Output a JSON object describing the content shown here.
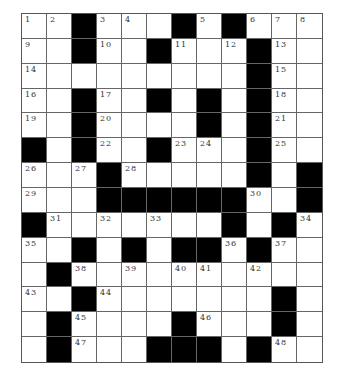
{
  "puzzle": {
    "rows": 14,
    "cols": 12,
    "colors": {
      "block": "#000000",
      "cell": "#ffffff",
      "line": "#666666",
      "number": "#333333"
    },
    "grid": [
      [
        "1",
        "2",
        "#",
        "3",
        "4",
        ".",
        "#",
        "5",
        "#",
        "6",
        "7",
        "8"
      ],
      [
        "9",
        ".",
        "#",
        "10",
        ".",
        "#",
        "11",
        ".",
        "12",
        "#",
        "13",
        "."
      ],
      [
        "14",
        ".",
        ".",
        ".",
        ".",
        ".",
        ".",
        ".",
        ".",
        "#",
        "15",
        "."
      ],
      [
        "16",
        ".",
        "#",
        "17",
        ".",
        "#",
        ".",
        "#",
        ".",
        "#",
        "18",
        "."
      ],
      [
        "19",
        ".",
        "#",
        "20",
        ".",
        ".",
        ".",
        "#",
        ".",
        "#",
        "21",
        "."
      ],
      [
        "#",
        ".",
        "#",
        "22",
        ".",
        "#",
        "23",
        "24",
        ".",
        "#",
        "25",
        "."
      ],
      [
        "26",
        ".",
        "27",
        "#",
        "28",
        ".",
        ".",
        ".",
        ".",
        "#",
        ".",
        "#"
      ],
      [
        "29",
        ".",
        ".",
        "#",
        "#",
        "#",
        "#",
        "#",
        "#",
        "30",
        ".",
        "#"
      ],
      [
        "#",
        "31",
        ".",
        "32",
        ".",
        "33",
        ".",
        ".",
        "#",
        ".",
        "#",
        "34"
      ],
      [
        "35",
        ".",
        "#",
        ".",
        "#",
        ".",
        "#",
        "#",
        "36",
        "#",
        "37",
        "."
      ],
      [
        ".",
        "#",
        "38",
        ".",
        "39",
        ".",
        "40",
        "41",
        ".",
        "42",
        ".",
        "."
      ],
      [
        "43",
        ".",
        "#",
        "44",
        ".",
        ".",
        ".",
        ".",
        ".",
        ".",
        "#",
        "."
      ],
      [
        ".",
        "#",
        "45",
        ".",
        ".",
        ".",
        "#",
        "46",
        ".",
        ".",
        "#",
        "."
      ],
      [
        ".",
        "#",
        "47",
        ".",
        ".",
        "#",
        "#",
        "#",
        ".",
        "#",
        "48",
        "."
      ]
    ]
  }
}
